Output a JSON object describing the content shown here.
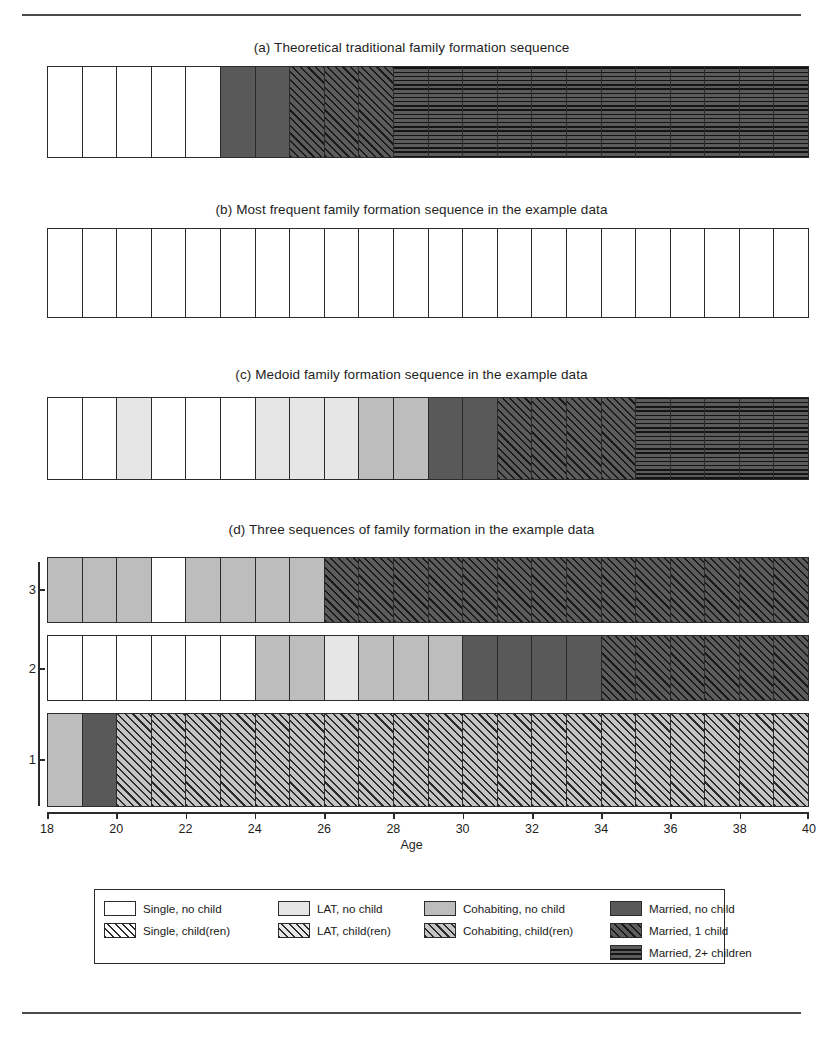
{
  "figure": {
    "axis_title": "Age",
    "panels": [
      {
        "id": "a",
        "title": "(a) Theoretical traditional family formation sequence"
      },
      {
        "id": "b",
        "title": "(b) Most frequent family formation sequence in the example data"
      },
      {
        "id": "c",
        "title": "(c) Medoid family formation sequence in the example data"
      },
      {
        "id": "d",
        "title": "(d) Three sequences of family formation in the example data"
      }
    ],
    "y_axis_labels": [
      "3",
      "2",
      "1"
    ]
  },
  "legend": {
    "entries": [
      {
        "label": "Single, no child",
        "state": "single-nochild",
        "class": "s-single-nochild"
      },
      {
        "label": "LAT, no child",
        "state": "lat-nochild",
        "class": "s-lat-nochild"
      },
      {
        "label": "Cohabiting, no child",
        "state": "cohab-nochild",
        "class": "s-cohab-nochild"
      },
      {
        "label": "Married, no child",
        "state": "married-nochild",
        "class": "s-married-nochild"
      },
      {
        "label": "Single, child(ren)",
        "state": "single-child",
        "class": "s-single-child"
      },
      {
        "label": "LAT, child(ren)",
        "state": "lat-child",
        "class": "s-lat-child"
      },
      {
        "label": "Cohabiting, child(ren)",
        "state": "cohab-child",
        "class": "s-cohab-child"
      },
      {
        "label": "Married, 1 child",
        "state": "married-1child",
        "class": "s-married-1child"
      },
      {
        "label": "Married, 2+ children",
        "state": "married-2child",
        "class": "s-married-2child"
      }
    ]
  },
  "chart_data": {
    "type": "heatmap",
    "xlabel": "Age",
    "ylabel": "",
    "xlim": [
      18,
      40
    ],
    "x_ticks": [
      18,
      20,
      22,
      24,
      26,
      28,
      30,
      32,
      34,
      36,
      38,
      40
    ],
    "n_positions": 22,
    "position_ages": [
      18,
      19,
      20,
      21,
      22,
      23,
      24,
      25,
      26,
      27,
      28,
      29,
      30,
      31,
      32,
      33,
      34,
      35,
      36,
      37,
      38,
      39
    ],
    "state_palette": {
      "single-nochild": "#ffffff",
      "lat-nochild": "#e6e6e6",
      "cohab-nochild": "#bdbdbd",
      "married-nochild": "#595959",
      "single-child": "#ffffff",
      "lat-child": "#e6e6e6",
      "cohab-child": "#c4c4c4",
      "married-1child": "#5c5c5c",
      "married-2child": "#5c5c5c"
    },
    "sequences": [
      {
        "panel": "a",
        "name": "Theoretical traditional family formation sequence",
        "states": [
          "single-nochild",
          "single-nochild",
          "single-nochild",
          "single-nochild",
          "single-nochild",
          "married-nochild",
          "married-nochild",
          "married-1child",
          "married-1child",
          "married-1child",
          "married-2child",
          "married-2child",
          "married-2child",
          "married-2child",
          "married-2child",
          "married-2child",
          "married-2child",
          "married-2child",
          "married-2child",
          "married-2child",
          "married-2child",
          "married-2child"
        ]
      },
      {
        "panel": "b",
        "name": "Most frequent family formation sequence in the example data",
        "states": [
          "single-nochild",
          "single-nochild",
          "single-nochild",
          "single-nochild",
          "single-nochild",
          "single-nochild",
          "single-nochild",
          "single-nochild",
          "single-nochild",
          "single-nochild",
          "single-nochild",
          "single-nochild",
          "single-nochild",
          "single-nochild",
          "single-nochild",
          "single-nochild",
          "single-nochild",
          "single-nochild",
          "single-nochild",
          "single-nochild",
          "single-nochild",
          "single-nochild"
        ]
      },
      {
        "panel": "c",
        "name": "Medoid family formation sequence in the example data",
        "states": [
          "single-nochild",
          "single-nochild",
          "lat-nochild",
          "single-nochild",
          "single-nochild",
          "single-nochild",
          "lat-nochild",
          "lat-nochild",
          "lat-nochild",
          "cohab-nochild",
          "cohab-nochild",
          "married-nochild",
          "married-nochild",
          "married-1child",
          "married-1child",
          "married-1child",
          "married-1child",
          "married-2child",
          "married-2child",
          "married-2child",
          "married-2child",
          "married-2child"
        ]
      },
      {
        "panel": "d",
        "row": 3,
        "name": "Sequence 3",
        "states": [
          "cohab-nochild",
          "cohab-nochild",
          "cohab-nochild",
          "single-nochild",
          "cohab-nochild",
          "cohab-nochild",
          "cohab-nochild",
          "cohab-nochild",
          "married-1child",
          "married-1child",
          "married-1child",
          "married-1child",
          "married-1child",
          "married-1child",
          "married-1child",
          "married-1child",
          "married-1child",
          "married-1child",
          "married-1child",
          "married-1child",
          "married-1child",
          "married-1child"
        ]
      },
      {
        "panel": "d",
        "row": 2,
        "name": "Sequence 2",
        "states": [
          "single-nochild",
          "single-nochild",
          "single-nochild",
          "single-nochild",
          "single-nochild",
          "single-nochild",
          "cohab-nochild",
          "cohab-nochild",
          "lat-nochild",
          "cohab-nochild",
          "cohab-nochild",
          "cohab-nochild",
          "married-nochild",
          "married-nochild",
          "married-nochild",
          "married-nochild",
          "married-1child",
          "married-1child",
          "married-1child",
          "married-1child",
          "married-1child",
          "married-1child"
        ]
      },
      {
        "panel": "d",
        "row": 1,
        "name": "Sequence 1",
        "states": [
          "cohab-nochild",
          "married-nochild",
          "cohab-child",
          "cohab-child",
          "cohab-child",
          "cohab-child",
          "cohab-child",
          "cohab-child",
          "cohab-child",
          "cohab-child",
          "cohab-child",
          "cohab-child",
          "cohab-child",
          "cohab-child",
          "cohab-child",
          "cohab-child",
          "cohab-child",
          "cohab-child",
          "cohab-child",
          "cohab-child",
          "cohab-child",
          "cohab-child"
        ]
      }
    ]
  }
}
